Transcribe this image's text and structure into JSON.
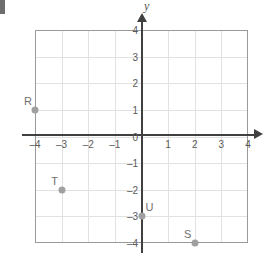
{
  "chart_data": {
    "type": "scatter",
    "title": "",
    "xlabel": "",
    "ylabel": "y",
    "xlim": [
      -4,
      4
    ],
    "ylim": [
      -4,
      4
    ],
    "grid": true,
    "legend": "none",
    "x_ticks": [
      "–4",
      "–3",
      "–2",
      "–1",
      "0",
      "1",
      "2",
      "3",
      "4"
    ],
    "x_tick_values": [
      -4,
      -3,
      -2,
      -1,
      0,
      1,
      2,
      3,
      4
    ],
    "y_ticks": [
      "–4",
      "–3",
      "–2",
      "–1",
      "0",
      "1",
      "2",
      "3",
      "4"
    ],
    "y_tick_values": [
      -4,
      -3,
      -2,
      -1,
      0,
      1,
      2,
      3,
      4
    ],
    "points": [
      {
        "label": "R",
        "x": -4,
        "y": 1,
        "label_pos": "above-left"
      },
      {
        "label": "T",
        "x": -3,
        "y": -2,
        "label_pos": "above-left"
      },
      {
        "label": "U",
        "x": 0,
        "y": -3,
        "label_pos": "above-right"
      },
      {
        "label": "S",
        "x": 2,
        "y": -4,
        "label_pos": "above-left"
      }
    ],
    "colors": {
      "point": "#a0a0a0",
      "axis": "#404040",
      "gridline": "#e2e2e2",
      "grid_border": "#9a9a9a",
      "tick_text": "#5a5a5a",
      "point_label": "#6f6f6f",
      "background": "#ffffff"
    }
  },
  "axes": {
    "y_axis_title": "y",
    "x_axis_title": ""
  }
}
